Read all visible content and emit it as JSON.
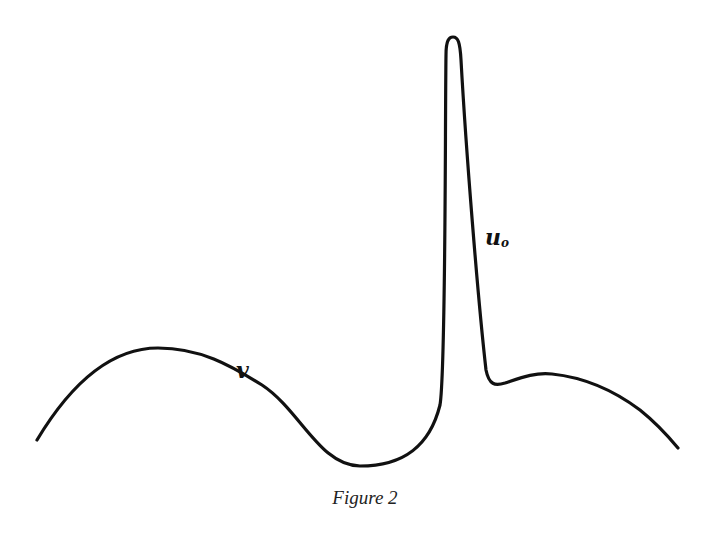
{
  "figure": {
    "caption": "Figure 2",
    "labels": {
      "v": "v",
      "u_base": "u",
      "u_sub": "o"
    },
    "stroke_color": "#111111",
    "background": "#ffffff"
  },
  "curve": {
    "description": "Single continuous curve: broad hump (v) on the left, trough, then a sharp narrow spike (u_o) followed by a small shoulder and falling tail on the right",
    "key_points": [
      {
        "name": "start",
        "x": 37,
        "y": 440
      },
      {
        "name": "hump-peak",
        "x": 158,
        "y": 348
      },
      {
        "name": "v-label-region",
        "x": 245,
        "y": 375
      },
      {
        "name": "trough",
        "x": 360,
        "y": 466
      },
      {
        "name": "spike-base-left",
        "x": 442,
        "y": 390
      },
      {
        "name": "spike-top",
        "x": 453,
        "y": 37
      },
      {
        "name": "spike-foot-right",
        "x": 492,
        "y": 384
      },
      {
        "name": "shoulder-peak",
        "x": 550,
        "y": 374
      },
      {
        "name": "end",
        "x": 678,
        "y": 448
      }
    ]
  }
}
